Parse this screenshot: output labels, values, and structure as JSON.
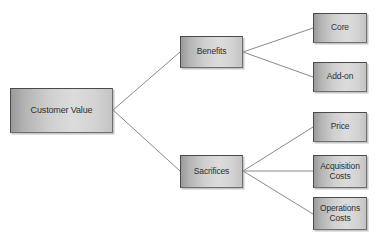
{
  "diagram": {
    "type": "hierarchy-tree",
    "title": "Customer Value",
    "orientation": "left-to-right",
    "background_color": "#ffffff",
    "node_fill_left": "#9a9a9a",
    "node_fill_right": "#dcdcdc",
    "node_border_color": "#4a4a4a",
    "edge_color": "#8a8a8a",
    "text_color": "#2f2f2f",
    "nodes": [
      {
        "id": "customer-value",
        "label": "Customer Value",
        "level": 0,
        "x": 10,
        "y": 88,
        "w": 103,
        "h": 45
      },
      {
        "id": "benefits",
        "label": "Benefits",
        "level": 1,
        "x": 180,
        "y": 36,
        "w": 63,
        "h": 32
      },
      {
        "id": "sacrifices",
        "label": "Sacrifices",
        "level": 1,
        "x": 180,
        "y": 155,
        "w": 63,
        "h": 33
      },
      {
        "id": "core",
        "label": "Core",
        "level": 2,
        "x": 313,
        "y": 13,
        "w": 54,
        "h": 30
      },
      {
        "id": "add-on",
        "label": "Add-on",
        "level": 2,
        "x": 313,
        "y": 62,
        "w": 54,
        "h": 30
      },
      {
        "id": "price",
        "label": "Price",
        "level": 2,
        "x": 313,
        "y": 112,
        "w": 54,
        "h": 30
      },
      {
        "id": "acquisition-costs",
        "label": "Acquisition\nCosts",
        "level": 2,
        "x": 313,
        "y": 155,
        "w": 54,
        "h": 33
      },
      {
        "id": "operations-costs",
        "label": "Operations\nCosts",
        "level": 2,
        "x": 313,
        "y": 197,
        "w": 54,
        "h": 33
      }
    ],
    "edges": [
      {
        "from": "customer-value",
        "to": "benefits",
        "x1": 113,
        "y1": 110,
        "x2": 180,
        "y2": 52
      },
      {
        "from": "customer-value",
        "to": "sacrifices",
        "x1": 113,
        "y1": 110,
        "x2": 180,
        "y2": 171
      },
      {
        "from": "benefits",
        "to": "core",
        "x1": 243,
        "y1": 52,
        "x2": 313,
        "y2": 28
      },
      {
        "from": "benefits",
        "to": "add-on",
        "x1": 243,
        "y1": 52,
        "x2": 313,
        "y2": 77
      },
      {
        "from": "sacrifices",
        "to": "price",
        "x1": 243,
        "y1": 171,
        "x2": 313,
        "y2": 127
      },
      {
        "from": "sacrifices",
        "to": "acquisition-costs",
        "x1": 243,
        "y1": 171,
        "x2": 313,
        "y2": 171
      },
      {
        "from": "sacrifices",
        "to": "operations-costs",
        "x1": 243,
        "y1": 171,
        "x2": 313,
        "y2": 214
      }
    ]
  }
}
